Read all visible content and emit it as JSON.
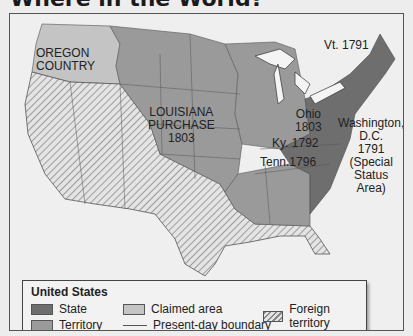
{
  "page": {
    "title": "Where in the World?"
  },
  "map": {
    "labels": {
      "oregon": "OREGON\nCOUNTRY",
      "louisiana": "LOUISIANA\nPURCHASE\n1803",
      "vermont": "Vt. 1791",
      "ohio": "Ohio\n1803",
      "kentucky": "Ky. 1792",
      "tennessee": "Tenn.1796",
      "washington": "Washington,\nD.C.\n1791\n(Special\nStatus\nArea)"
    },
    "colors": {
      "state": "#6e6e6e",
      "territory": "#9a9a9a",
      "claimed": "#c4c4c4",
      "foreign_bg": "#e4e4e4",
      "foreign_stripe": "#8a8a8a",
      "water": "#f4f4f4"
    }
  },
  "legend": {
    "title": "United States",
    "items": [
      {
        "label": "State",
        "type": "state"
      },
      {
        "label": "Territory",
        "type": "territory"
      },
      {
        "label": "Claimed area",
        "type": "claimed"
      },
      {
        "label": "Present-day boundary",
        "type": "line"
      },
      {
        "label": "Foreign territory",
        "type": "foreign"
      }
    ]
  }
}
